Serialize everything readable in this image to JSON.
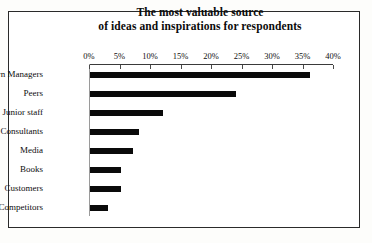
{
  "chart_data": {
    "type": "bar",
    "orientation": "horizontal",
    "title": "The most valuable source of ideas and inspirations for respondents",
    "title_lines": [
      "The most valuable source",
      "of ideas and inspirations for respondents"
    ],
    "xlabel": "",
    "ylabel": "",
    "categories": [
      "Own Managers",
      "Peers",
      "Junior staff",
      "Consultants",
      "Media",
      "Books",
      "Customers",
      "Competitors"
    ],
    "values": [
      36,
      24,
      12,
      8,
      7,
      5,
      5,
      3
    ],
    "value_unit": "%",
    "xlim": [
      0,
      40
    ],
    "xtick_step": 5,
    "xticks": [
      0,
      5,
      10,
      15,
      20,
      25,
      30,
      35,
      40
    ],
    "xtick_labels": [
      "0%",
      "5%",
      "10%",
      "15%",
      "20%",
      "25%",
      "30%",
      "35%",
      "40%"
    ],
    "grid": false,
    "legend": false,
    "bar_color": "#0a0a0a",
    "axis_color": "#3a3a3a",
    "baseline_color": "#9a9a9a",
    "frame_color": "#2a2a2a",
    "background_color": "#ffffff"
  }
}
